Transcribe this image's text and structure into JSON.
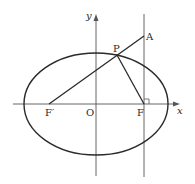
{
  "diagram": {
    "type": "ellipse-geometry",
    "axes": {
      "x_label": "x",
      "y_label": "y",
      "origin_label": "O"
    },
    "points": {
      "P": "P",
      "A": "A",
      "F": "F",
      "F_prime": "F′"
    },
    "elements": [
      "ellipse centered at O",
      "segment F′A passing through P",
      "segment PF",
      "vertical line through F perpendicular to x-axis",
      "right-angle mark at F"
    ],
    "colors": {
      "stroke": "#2a2a2a",
      "background": "#ffffff"
    }
  }
}
